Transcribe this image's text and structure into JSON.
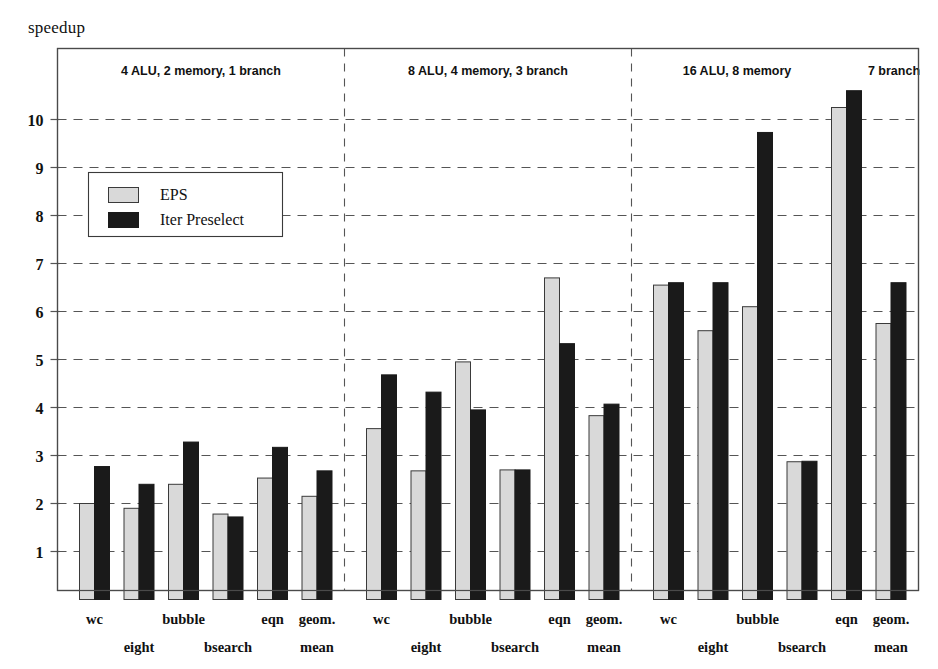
{
  "chart_data": {
    "type": "bar",
    "title": "",
    "ylabel": "speedup",
    "xlabel": "",
    "ylim": [
      0,
      11.2
    ],
    "yticks": [
      1,
      2,
      3,
      4,
      5,
      6,
      7,
      8,
      9,
      10
    ],
    "grid": true,
    "grid_style": "dashed-horizontal",
    "legend": {
      "position": "upper-left-inside",
      "entries": [
        {
          "name": "EPS",
          "color": "#d9d9d9"
        },
        {
          "name": "Iter Preselect",
          "color": "#1a1a1a"
        }
      ]
    },
    "categories": [
      "wc",
      "eight",
      "bubble",
      "bsearch",
      "eqn",
      "geom. mean"
    ],
    "panels": [
      {
        "label": "4 ALU, 2 memory, 1 branch",
        "series": [
          {
            "name": "EPS",
            "values": [
              2.0,
              1.9,
              2.4,
              1.78,
              2.53,
              2.15
            ]
          },
          {
            "name": "Iter Preselect",
            "values": [
              2.77,
              2.4,
              3.28,
              1.72,
              3.17,
              2.68
            ]
          }
        ]
      },
      {
        "label": "8 ALU, 4 memory, 3 branch",
        "series": [
          {
            "name": "EPS",
            "values": [
              3.56,
              2.68,
              4.95,
              2.7,
              6.7,
              3.83
            ]
          },
          {
            "name": "Iter Preselect",
            "values": [
              4.68,
              4.32,
              3.95,
              2.7,
              5.33,
              4.07
            ]
          }
        ]
      },
      {
        "label": "16 ALU, 8 memory, 7 branch",
        "label_part_1": "16 ALU, 8 memory",
        "label_part_2": "7 branch",
        "series": [
          {
            "name": "EPS",
            "values": [
              6.55,
              5.6,
              6.1,
              2.87,
              10.25,
              5.75
            ]
          },
          {
            "name": "Iter Preselect",
            "values": [
              6.6,
              6.6,
              9.73,
              2.88,
              10.6,
              6.6
            ]
          }
        ]
      }
    ]
  },
  "axis": {
    "y_title": "speedup",
    "tick_labels": [
      "10",
      "9",
      "8",
      "7",
      "6",
      "5",
      "4",
      "3",
      "2",
      "1"
    ]
  },
  "category_labels": {
    "row_top": [
      "wc",
      "bubble",
      "eqn",
      "geom."
    ],
    "row_bottom": [
      "eight",
      "bsearch",
      "mean"
    ]
  },
  "colors": {
    "eps_fill": "#d9d9d9",
    "iter_fill": "#1a1a1a",
    "bar_stroke": "#3a3a3a",
    "axis": "#4a4a4a",
    "grid": "#555555",
    "text": "#111111",
    "background": "#ffffff"
  }
}
